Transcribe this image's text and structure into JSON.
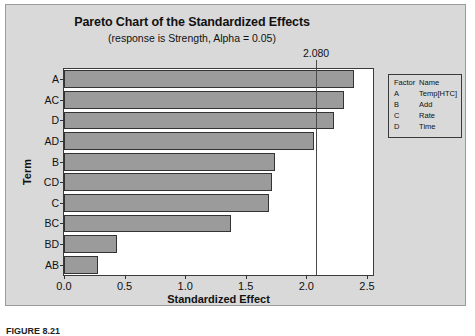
{
  "figure": {
    "caption": "FIGURE 8.21"
  },
  "legend": {
    "headers": [
      "Factor",
      "Name"
    ],
    "rows": [
      {
        "factor": "A",
        "name": "Temp[HTC]"
      },
      {
        "factor": "B",
        "name": "Add"
      },
      {
        "factor": "C",
        "name": "Rate"
      },
      {
        "factor": "D",
        "name": "Time"
      }
    ]
  },
  "chart_data": {
    "type": "bar",
    "orientation": "horizontal",
    "title": "Pareto Chart of the Standardized Effects",
    "subtitle": "(response is Strength, Alpha = 0.05)",
    "xlabel": "Standardized Effect",
    "ylabel": "Term",
    "categories": [
      "A",
      "AC",
      "D",
      "AD",
      "B",
      "CD",
      "C",
      "BC",
      "BD",
      "AB"
    ],
    "values": [
      2.39,
      2.31,
      2.23,
      2.06,
      1.74,
      1.72,
      1.69,
      1.38,
      0.44,
      0.28
    ],
    "xlim": [
      0.0,
      2.55
    ],
    "xticks": [
      0.0,
      0.5,
      1.0,
      1.5,
      2.0,
      2.5
    ],
    "xticklabels": [
      "0.0",
      "0.5",
      "1.0",
      "1.5",
      "2.0",
      "2.5"
    ],
    "grid": false,
    "legend_position": "right-outside",
    "reference_line": {
      "value": 2.08,
      "label": "2.080"
    },
    "colors": {
      "bar_fill": "#9b9b9b",
      "bar_edge": "#333333",
      "plot_background": "#ffffff",
      "panel_background": "#d9d9d9",
      "reference_line": "#4a4a4a"
    }
  }
}
